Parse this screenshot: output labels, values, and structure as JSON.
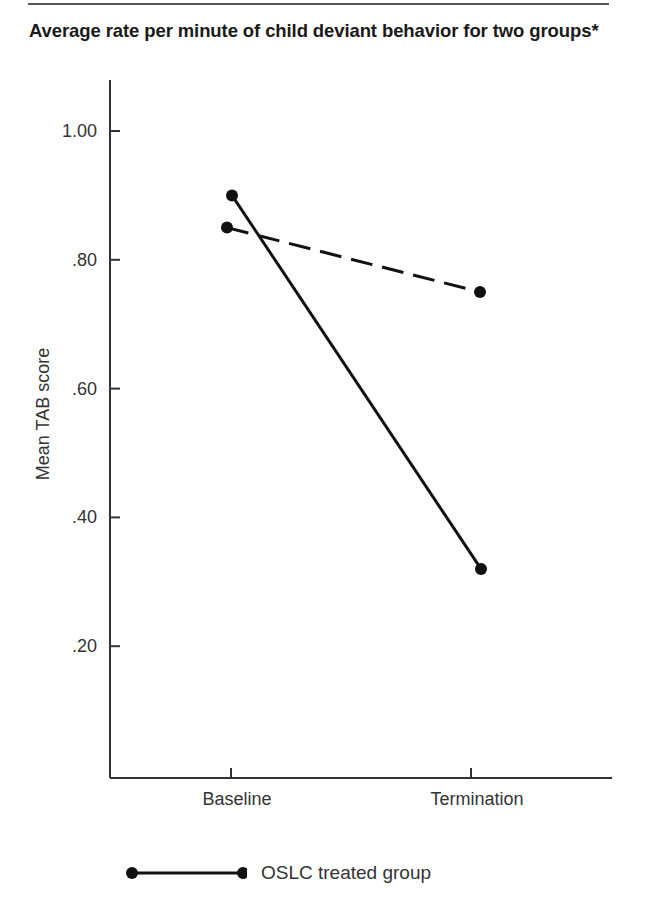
{
  "page": {
    "title": "Average rate per minute of child deviant behavior for two groups*"
  },
  "chart_data": {
    "type": "line",
    "title": "Average rate per minute of child deviant behavior for two groups*",
    "xlabel": "",
    "ylabel": "Mean TAB score",
    "categories": [
      "Baseline",
      "Termination"
    ],
    "y_ticks": [
      1.0,
      0.8,
      0.6,
      0.4,
      0.2
    ],
    "y_tick_labels": [
      "1.00",
      ".80",
      ".60",
      ".40",
      ".20"
    ],
    "ylim": [
      0,
      1.08
    ],
    "grid": false,
    "legend_position": "bottom",
    "series": [
      {
        "name": "OSLC treated group",
        "line_style": "solid",
        "marker": "circle",
        "color": "#111111",
        "values": [
          0.9,
          0.32
        ]
      },
      {
        "name": "",
        "line_style": "dashed",
        "marker": "circle",
        "color": "#111111",
        "values": [
          0.85,
          0.75
        ]
      }
    ]
  },
  "legend": {
    "items": [
      {
        "label": "OSLC treated group",
        "style": "solid"
      }
    ]
  }
}
